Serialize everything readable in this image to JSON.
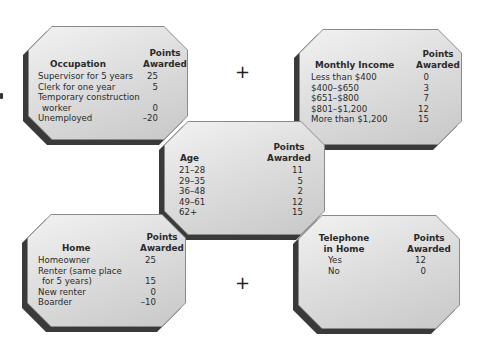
{
  "figure": {
    "plus_signs": [
      "+",
      "+"
    ],
    "panels": {
      "occupation": {
        "title": "Occupation",
        "points_header": [
          "Points",
          "Awarded"
        ],
        "rows": [
          {
            "label": [
              "Supervisor for 5 years"
            ],
            "points": "25"
          },
          {
            "label": [
              "Clerk for one year"
            ],
            "points": "5"
          },
          {
            "label": [
              "Temporary construction",
              "worker"
            ],
            "points": "0"
          },
          {
            "label": [
              "Unemployed"
            ],
            "points": "–20"
          }
        ]
      },
      "monthly_income": {
        "title": "Monthly Income",
        "points_header": [
          "Points",
          "Awarded"
        ],
        "rows": [
          {
            "label": [
              "Less than $400"
            ],
            "points": "0"
          },
          {
            "label": [
              "$400–$650"
            ],
            "points": "3"
          },
          {
            "label": [
              "$651–$800"
            ],
            "points": "7"
          },
          {
            "label": [
              "$801–$1,200"
            ],
            "points": "12"
          },
          {
            "label": [
              "More than $1,200"
            ],
            "points": "15"
          }
        ]
      },
      "age": {
        "title": "Age",
        "points_header": [
          "Points",
          "Awarded"
        ],
        "rows": [
          {
            "label": [
              "21–28"
            ],
            "points": "11"
          },
          {
            "label": [
              "29–35"
            ],
            "points": "5"
          },
          {
            "label": [
              "36–48"
            ],
            "points": "2"
          },
          {
            "label": [
              "49–61"
            ],
            "points": "12"
          },
          {
            "label": [
              "62+"
            ],
            "points": "15"
          }
        ]
      },
      "home": {
        "title": "Home",
        "points_header": [
          "Points",
          "Awarded"
        ],
        "rows": [
          {
            "label": [
              "Homeowner"
            ],
            "points": "25"
          },
          {
            "label": [
              "Renter (same place",
              "for 5 years)"
            ],
            "points": "15"
          },
          {
            "label": [
              "New renter"
            ],
            "points": "0"
          },
          {
            "label": [
              "Boarder"
            ],
            "points": "–10"
          }
        ]
      },
      "telephone": {
        "title": [
          "Telephone",
          "in Home"
        ],
        "points_header": [
          "Points",
          "Awarded"
        ],
        "rows": [
          {
            "label": [
              "Yes"
            ],
            "points": "12"
          },
          {
            "label": [
              "No"
            ],
            "points": "0"
          }
        ]
      }
    }
  }
}
